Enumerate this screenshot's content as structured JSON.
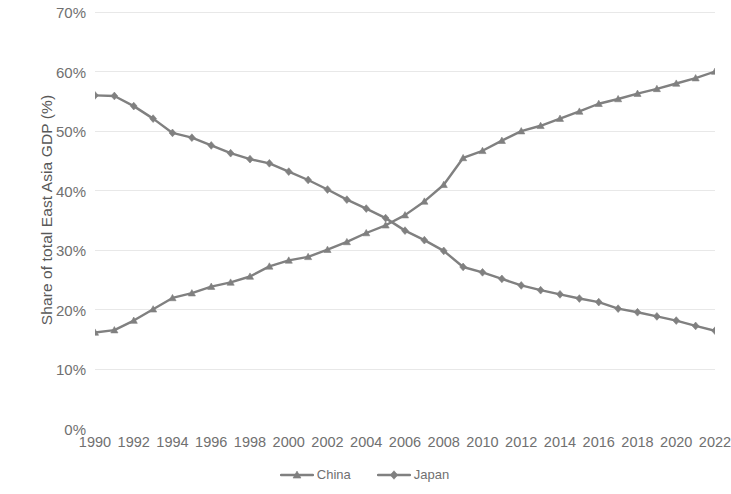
{
  "chart_data": {
    "type": "line",
    "title": "",
    "xlabel": "",
    "ylabel": "Share of total East Asia GDP (%)",
    "ylim": [
      0,
      70
    ],
    "xlim": [
      1990,
      2022
    ],
    "grid": true,
    "legend_position": "bottom",
    "y_ticks": [
      0,
      10,
      20,
      30,
      40,
      50,
      60,
      70
    ],
    "y_tick_labels": [
      "0%",
      "10%",
      "20%",
      "30%",
      "40%",
      "50%",
      "60%",
      "70%"
    ],
    "x_tick_labels": [
      "1990",
      "1992",
      "1994",
      "1996",
      "1998",
      "2000",
      "2002",
      "2004",
      "2006",
      "2008",
      "2010",
      "2012",
      "2014",
      "2016",
      "2018",
      "2020",
      "2022"
    ],
    "x": [
      1990,
      1991,
      1992,
      1993,
      1994,
      1995,
      1996,
      1997,
      1998,
      1999,
      2000,
      2001,
      2002,
      2003,
      2004,
      2005,
      2006,
      2007,
      2008,
      2009,
      2010,
      2011,
      2012,
      2013,
      2014,
      2015,
      2016,
      2017,
      2018,
      2019,
      2020,
      2021,
      2022
    ],
    "series": [
      {
        "name": "China",
        "marker": "triangle",
        "color": "#808080",
        "values": [
          16.2,
          16.6,
          18.2,
          20.1,
          22.0,
          22.8,
          23.9,
          24.6,
          25.6,
          27.3,
          28.3,
          28.9,
          30.1,
          31.4,
          32.9,
          34.2,
          35.9,
          38.2,
          41.0,
          45.5,
          46.7,
          48.4,
          50.0,
          50.9,
          52.1,
          53.3,
          54.6,
          55.4,
          56.3,
          57.1,
          58.0,
          58.9,
          60.0
        ]
      },
      {
        "name": "Japan",
        "marker": "diamond",
        "color": "#808080",
        "values": [
          56.0,
          55.9,
          54.2,
          52.1,
          49.7,
          48.9,
          47.6,
          46.3,
          45.3,
          44.6,
          43.2,
          41.8,
          40.2,
          38.5,
          37.0,
          35.4,
          33.3,
          31.7,
          29.9,
          27.2,
          26.3,
          25.2,
          24.1,
          23.3,
          22.6,
          21.9,
          21.3,
          20.2,
          19.6,
          18.9,
          18.2,
          17.3,
          16.5
        ]
      }
    ],
    "colors": {
      "line": "#808080",
      "gridline": "#e8e8e8",
      "tick_text": "#707070",
      "axis_title": "#585858",
      "background": "#ffffff"
    }
  },
  "legend": {
    "entries": [
      {
        "label": "China"
      },
      {
        "label": "Japan"
      }
    ]
  }
}
